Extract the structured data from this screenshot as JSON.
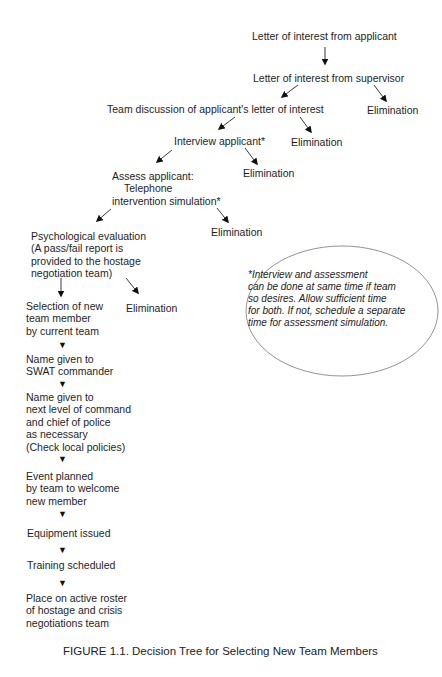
{
  "diagram": {
    "type": "decision-tree",
    "nodes": {
      "letter_applicant": "Letter of interest from applicant",
      "letter_supervisor": "Letter of interest from supervisor",
      "team_discussion": "Team discussion of applicant's letter of interest",
      "interview": "Interview applicant*",
      "assess": [
        "Assess applicant:",
        "Telephone",
        "intervention simulation*"
      ],
      "psych_eval": [
        "Psychological evaluation",
        "(A pass/fail report is",
        "provided to the hostage",
        "negotiation team)"
      ],
      "selection": [
        "Selection of new",
        "team member",
        "by current team"
      ],
      "swat": [
        "Name given to",
        "SWAT commander"
      ],
      "next_level": [
        "Name given to",
        "next level of command",
        "and chief of police",
        "as necessary",
        "(Check local policies)"
      ],
      "event": [
        "Event planned",
        "by team to welcome",
        "new member"
      ],
      "equipment": "Equipment issued",
      "training": "Training scheduled",
      "roster": [
        "Place on active roster",
        "of hostage and crisis",
        "negotiations team"
      ]
    },
    "eliminations": {
      "after_supervisor": "Elimination",
      "after_team_discussion": "Elimination",
      "after_interview": "Elimination",
      "after_assess": "Elimination",
      "after_psych_eval": "Elimination"
    },
    "note": [
      "*Interview and assessment",
      "can be done at same time if team",
      "so desires. Allow sufficient time",
      "for both. If not, schedule a separate",
      "time for assessment simulation."
    ],
    "step_marker": "▼"
  },
  "caption": "FIGURE 1.1. Decision Tree for Selecting New Team Members"
}
